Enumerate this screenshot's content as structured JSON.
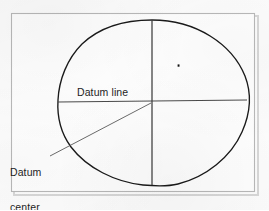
{
  "figure": {
    "type": "technical-drawing",
    "labels": {
      "datum_line": "Datum line",
      "datum_center_line1": "Datum",
      "datum_center_line2": "center"
    },
    "caption": "",
    "colors": {
      "outline": "#1a1a1a",
      "datum_line": "#4b4b4b",
      "leader_line": "#5a5a5a",
      "frame": "#b9b9b9",
      "paper": "#fdfdfd",
      "text": "#1d1d1d",
      "point_marker": "#111111"
    },
    "geometry": {
      "frame": {
        "x": 11,
        "y": 13,
        "width": 244,
        "height": 179
      },
      "datum_line": {
        "x1": 58,
        "y1": 102,
        "x2": 247,
        "y2": 100
      },
      "center_line": {
        "x": 152,
        "y1": 20,
        "y2": 185
      },
      "datum_center": {
        "x": 152,
        "y": 102
      },
      "point_marker": {
        "x": 178,
        "y": 65
      },
      "leader_line": {
        "x1": 50,
        "y1": 156,
        "x2": 151,
        "y2": 103
      }
    }
  }
}
